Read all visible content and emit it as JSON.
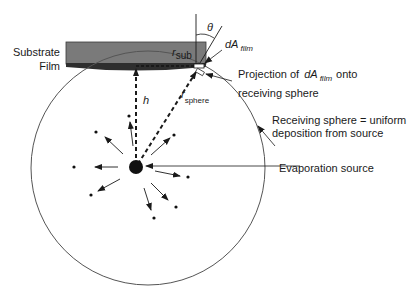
{
  "diagram": {
    "type": "evaporation-geometry-schematic",
    "labels": {
      "substrate": "Substrate",
      "film": "Film",
      "r_sub_main": "r",
      "r_sub_subscript": "sub",
      "theta": "θ",
      "dA_film_main": "dA",
      "dA_film_subscript": "film",
      "projection_line1_prefix": "Projection of",
      "projection_dA_main": "dA",
      "projection_dA_subscript": "film",
      "projection_line1_suffix": "onto",
      "projection_line2": "receiving sphere",
      "h": "h",
      "r_sphere_main": "r",
      "r_sphere_subscript": "sphere",
      "receiving_sphere_line1": "Receiving sphere = uniform",
      "receiving_sphere_line2": "deposition from source",
      "evaporation_source": "Evaporation source"
    },
    "colors": {
      "substrate_fill": "#7a7a7a",
      "film_fill": "#2e2e2e",
      "line": "#1a1a1a",
      "sphere_stroke": "#555555",
      "background": "#ffffff"
    }
  }
}
